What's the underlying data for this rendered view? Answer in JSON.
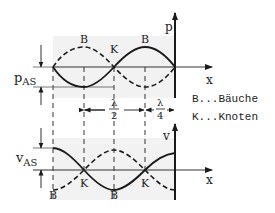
{
  "diagram": {
    "type": "standing-wave",
    "colors": {
      "ink": "#1a1a1a",
      "shade": "#f1f1f1",
      "guide": "#333333"
    },
    "geometry": {
      "node_x": [
        53,
        114,
        175
      ],
      "antinode_x": [
        84,
        145
      ],
      "upper_axis_y": 67,
      "lower_axis_y": 170,
      "amplitude_px": 20
    },
    "upper_plot": {
      "y_axis_label": "p",
      "x_axis_label": "x",
      "amplitude_label": "p",
      "amplitude_subscript": "AS",
      "point_labels": [
        {
          "text": "B",
          "x": 84,
          "y": 42
        },
        {
          "text": "K",
          "x": 114,
          "y": 50
        },
        {
          "text": "B",
          "x": 145,
          "y": 42
        }
      ]
    },
    "lower_plot": {
      "y_axis_label": "v",
      "x_axis_label": "x",
      "amplitude_label": "v",
      "amplitude_subscript": "AS",
      "point_labels": [
        {
          "text": "B",
          "x": 53,
          "y": 197
        },
        {
          "text": "K",
          "x": 84,
          "y": 186
        },
        {
          "text": "B",
          "x": 114,
          "y": 197
        },
        {
          "text": "K",
          "x": 145,
          "y": 186
        }
      ]
    },
    "dimensions": {
      "half_wavelength": {
        "numerator": "λ",
        "denominator": "2"
      },
      "quarter_wavelength": {
        "numerator": "λ",
        "denominator": "4"
      }
    },
    "legend": [
      {
        "text": "B...Bäuche"
      },
      {
        "text": "K...Knoten"
      }
    ]
  }
}
